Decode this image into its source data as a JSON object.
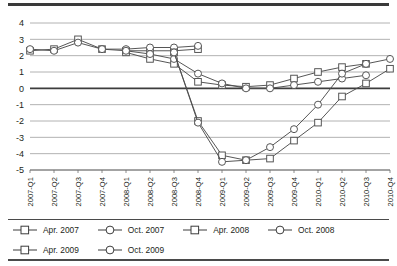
{
  "chart_data": {
    "type": "line",
    "title": "",
    "xlabel": "",
    "ylabel": "",
    "ylim": [
      -5,
      4
    ],
    "yticks": [
      4,
      3,
      2,
      1,
      0,
      -1,
      -2,
      -3,
      -4,
      -5
    ],
    "ytick_labels": [
      "4",
      "3",
      "2",
      "1",
      "0",
      "-1",
      "-2",
      "-3",
      "-4",
      "-5"
    ],
    "grid": true,
    "legend_position": "bottom",
    "categories": [
      "2007-Q1",
      "2007-Q2",
      "2007-Q3",
      "2007-Q4",
      "2008-Q1",
      "2008-Q2",
      "2008-Q3",
      "2008-Q4",
      "2009-Q1",
      "2009-Q2",
      "2009-Q3",
      "2009-Q4",
      "2010-Q1",
      "2010-Q2",
      "2010-Q3",
      "2010-Q4"
    ],
    "series": [
      {
        "name": "Apr. 2007",
        "marker": "square",
        "color": "#4d4d4d",
        "values": [
          2.3,
          2.4,
          3.0,
          2.4,
          2.3,
          2.3,
          2.3,
          2.4,
          null,
          null,
          null,
          null,
          null,
          null,
          null,
          null
        ]
      },
      {
        "name": "Oct. 2007",
        "marker": "circle",
        "color": "#4d4d4d",
        "values": [
          2.4,
          2.3,
          2.8,
          2.4,
          2.4,
          2.5,
          2.5,
          2.6,
          null,
          null,
          null,
          null,
          null,
          null,
          null,
          null
        ]
      },
      {
        "name": "Apr. 2008",
        "marker": "square",
        "color": "#4d4d4d",
        "values": [
          null,
          null,
          null,
          null,
          2.2,
          1.8,
          1.5,
          0.4,
          0.2,
          0.1,
          0.2,
          0.6,
          1.0,
          1.3,
          1.5,
          null
        ]
      },
      {
        "name": "Oct. 2008",
        "marker": "circle",
        "color": "#4d4d4d",
        "values": [
          null,
          null,
          null,
          null,
          2.3,
          2.1,
          1.8,
          0.9,
          0.3,
          0.0,
          0.0,
          0.2,
          0.4,
          0.6,
          0.8,
          null
        ]
      },
      {
        "name": "Apr. 2009",
        "marker": "square",
        "color": "#4d4d4d",
        "values": [
          null,
          null,
          null,
          null,
          null,
          null,
          2.2,
          -2.0,
          -4.1,
          -4.4,
          -4.3,
          -3.2,
          -2.1,
          -0.5,
          0.3,
          1.2
        ]
      },
      {
        "name": "Oct. 2009",
        "marker": "circle",
        "color": "#4d4d4d",
        "values": [
          null,
          null,
          null,
          null,
          null,
          null,
          2.2,
          -2.1,
          -4.5,
          -4.4,
          -3.6,
          -2.5,
          -1.0,
          0.9,
          1.5,
          1.8
        ]
      }
    ]
  },
  "legend": {
    "rows": [
      [
        {
          "label": "Apr. 2007",
          "marker": "square"
        },
        {
          "label": "Oct. 2007",
          "marker": "circle"
        },
        {
          "label": "Apr. 2008",
          "marker": "square"
        },
        {
          "label": "Oct. 2008",
          "marker": "circle"
        }
      ],
      [
        {
          "label": "Apr. 2009",
          "marker": "square"
        },
        {
          "label": "Oct. 2009",
          "marker": "circle"
        }
      ]
    ]
  }
}
